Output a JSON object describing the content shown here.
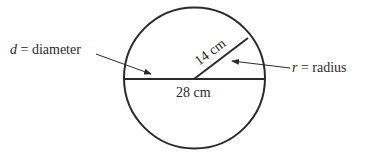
{
  "diagram": {
    "diameter_label": {
      "var": "d",
      "text": " = diameter"
    },
    "radius_label": {
      "var": "r",
      "text": " = radius"
    },
    "radius_measure": "14 cm",
    "diameter_measure": "28 cm",
    "colors": {
      "stroke": "#2a2a2a",
      "background": "#ffffff"
    }
  }
}
